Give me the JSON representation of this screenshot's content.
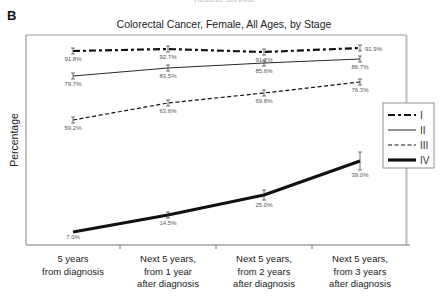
{
  "figure": {
    "panel_letter": "B",
    "clipped_top_text": "Relative Survival"
  },
  "chart_data": {
    "type": "line",
    "title": "Colorectal Cancer, Female, All Ages, by Stage",
    "xlabel": "",
    "ylabel": "Percentage",
    "categories": [
      [
        "5 years",
        "from diagnosis"
      ],
      [
        "Next 5 years,",
        "from 1 year",
        "after diagnosis"
      ],
      [
        "Next 5 years,",
        "from 2 years",
        "after diagnosis"
      ],
      [
        "Next 5 years,",
        "from 3 years",
        "after diagnosis"
      ]
    ],
    "ylim": [
      0,
      100
    ],
    "grid": false,
    "legend_position": "right",
    "series": [
      {
        "name": "I",
        "values": [
          91.8,
          92.7,
          91.2,
          91.9
        ],
        "labels": [
          "91.8%",
          "92.7%",
          "91.2%",
          "91.9%"
        ],
        "style": "dash-dot-heavy",
        "pixel_y": [
          51,
          49,
          52,
          48
        ]
      },
      {
        "name": "II",
        "values": [
          79.7,
          83.5,
          85.6,
          86.7
        ],
        "labels": [
          "79.7%",
          "83.5%",
          "85.6%",
          "86.7%"
        ],
        "style": "thin-solid",
        "pixel_y": [
          76,
          68,
          63,
          59
        ]
      },
      {
        "name": "III",
        "values": [
          59.2,
          63.6,
          69.8,
          76.3
        ],
        "labels": [
          "59.2%",
          "63.6%",
          "69.8%",
          "76.3%"
        ],
        "style": "dashed",
        "pixel_y": [
          120,
          103,
          93,
          82
        ]
      },
      {
        "name": "IV",
        "values": [
          7.0,
          14.5,
          25.0,
          39.0
        ],
        "labels": [
          "7.0%",
          "14.5%",
          "25.0%",
          "39.0%"
        ],
        "style": "thick-solid",
        "pixel_y": [
          232,
          215,
          195,
          161
        ]
      }
    ]
  },
  "colors": {
    "line": "#111111",
    "axis": "#777777",
    "frame": "#999999",
    "label": "#555555"
  }
}
